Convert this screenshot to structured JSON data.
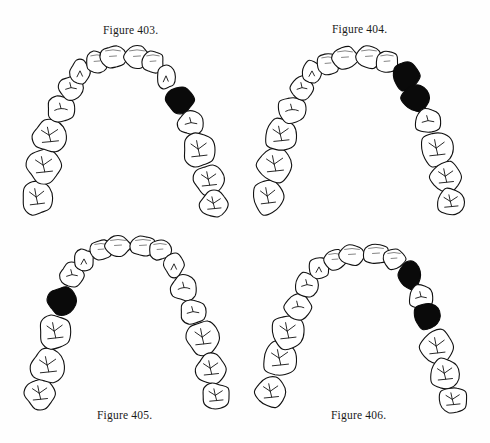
{
  "page": {
    "background": "#fefefe",
    "ink_color": "#111111",
    "highlight_color": "#0a0a0a"
  },
  "figures": [
    {
      "id": "fig-403",
      "caption": "Figure 403.",
      "caption_position": "top",
      "offset": [
        0,
        0
      ],
      "caption_xy": [
        103,
        36
      ],
      "highlighted_teeth": [
        "right-premolar-1"
      ],
      "highlighted_indices": [
        11
      ]
    },
    {
      "id": "fig-404",
      "caption": "Figure 404.",
      "caption_position": "top",
      "offset": [
        245,
        0
      ],
      "caption_xy": [
        87,
        35
      ],
      "highlighted_teeth": [
        "right-canine",
        "right-premolar-1"
      ],
      "highlighted_indices": [
        10,
        11
      ]
    },
    {
      "id": "fig-405",
      "caption": "Figure 405.",
      "caption_position": "bottom",
      "offset": [
        0,
        222
      ],
      "caption_xy": [
        97,
        199
      ],
      "highlighted_teeth": [
        "left-premolar-2"
      ],
      "highlighted_indices": [
        3
      ]
    },
    {
      "id": "fig-406",
      "caption": "Figure 406.",
      "caption_position": "bottom",
      "offset": [
        245,
        222
      ],
      "caption_xy": [
        86,
        199
      ],
      "highlighted_teeth": [
        "right-canine",
        "right-premolar-2"
      ],
      "highlighted_indices": [
        10,
        12
      ]
    }
  ],
  "arch_layouts": {
    "fig-403": [
      [
        37,
        198,
        15,
        17
      ],
      [
        44,
        166,
        17,
        17
      ],
      [
        50,
        136,
        17,
        16
      ],
      [
        61,
        109,
        14,
        13
      ],
      [
        71,
        88,
        12,
        12
      ],
      [
        80,
        72,
        10,
        12
      ],
      [
        97,
        62,
        11,
        11
      ],
      [
        113,
        57,
        13,
        11
      ],
      [
        137,
        57,
        13,
        11
      ],
      [
        153,
        62,
        11,
        11
      ],
      [
        166,
        77,
        9,
        12
      ],
      [
        180,
        100,
        14,
        13
      ],
      [
        191,
        123,
        13,
        12
      ],
      [
        199,
        150,
        16,
        17
      ],
      [
        209,
        180,
        15,
        15
      ],
      [
        214,
        204,
        14,
        13
      ]
    ],
    "fig-404": [
      [
        23,
        197,
        15,
        17
      ],
      [
        30,
        165,
        17,
        17
      ],
      [
        36,
        135,
        16,
        16
      ],
      [
        47,
        110,
        14,
        13
      ],
      [
        57,
        88,
        11,
        12
      ],
      [
        67,
        72,
        10,
        11
      ],
      [
        83,
        64,
        11,
        11
      ],
      [
        100,
        58,
        13,
        11
      ],
      [
        124,
        57,
        13,
        11
      ],
      [
        142,
        62,
        11,
        11
      ],
      [
        161,
        76,
        13,
        14
      ],
      [
        171,
        98,
        14,
        13
      ],
      [
        183,
        121,
        13,
        12
      ],
      [
        192,
        149,
        16,
        17
      ],
      [
        201,
        177,
        15,
        15
      ],
      [
        206,
        202,
        14,
        13
      ]
    ],
    "fig-405": [
      [
        40,
        172,
        15,
        15
      ],
      [
        48,
        144,
        17,
        17
      ],
      [
        55,
        110,
        16,
        17
      ],
      [
        62,
        79,
        14,
        14
      ],
      [
        72,
        53,
        12,
        12
      ],
      [
        84,
        38,
        10,
        11
      ],
      [
        101,
        28,
        11,
        10
      ],
      [
        118,
        24,
        13,
        10
      ],
      [
        143,
        24,
        13,
        10
      ],
      [
        160,
        28,
        11,
        10
      ],
      [
        174,
        43,
        10,
        12
      ],
      [
        184,
        66,
        13,
        13
      ],
      [
        193,
        90,
        13,
        12
      ],
      [
        203,
        116,
        16,
        17
      ],
      [
        211,
        147,
        15,
        15
      ],
      [
        216,
        174,
        14,
        13
      ]
    ],
    "fig-406": [
      [
        26,
        170,
        15,
        15
      ],
      [
        35,
        137,
        17,
        17
      ],
      [
        43,
        110,
        16,
        17
      ],
      [
        53,
        85,
        13,
        13
      ],
      [
        62,
        63,
        12,
        12
      ],
      [
        74,
        46,
        10,
        11
      ],
      [
        90,
        38,
        11,
        10
      ],
      [
        107,
        33,
        13,
        10
      ],
      [
        131,
        32,
        13,
        10
      ],
      [
        149,
        37,
        11,
        10
      ],
      [
        165,
        53,
        11,
        14
      ],
      [
        176,
        75,
        12,
        12
      ],
      [
        182,
        94,
        13,
        13
      ],
      [
        192,
        125,
        16,
        17
      ],
      [
        200,
        152,
        15,
        15
      ],
      [
        208,
        178,
        14,
        13
      ]
    ]
  },
  "tooth_names": [
    "left-molar-3",
    "left-molar-2",
    "left-molar-1",
    "left-premolar-2",
    "left-premolar-1",
    "left-canine",
    "left-lateral-incisor",
    "left-central-incisor",
    "right-central-incisor",
    "right-lateral-incisor",
    "right-canine",
    "right-premolar-1",
    "right-premolar-2",
    "right-molar-1",
    "right-molar-2",
    "right-molar-3"
  ]
}
